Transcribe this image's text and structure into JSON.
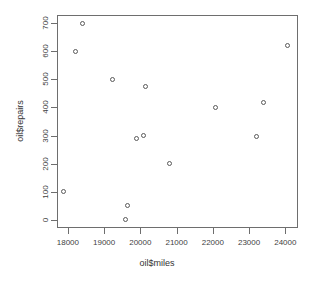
{
  "chart_data": {
    "type": "scatter",
    "title": "",
    "xlabel": "oil$miles",
    "ylabel": "oil$repairs",
    "xlim": [
      17700,
      24350
    ],
    "ylim": [
      -30,
      730
    ],
    "xticks": [
      18000,
      19000,
      20000,
      21000,
      22000,
      23000,
      24000
    ],
    "xtick_labels": [
      "18000",
      "19000",
      "20000",
      "21000",
      "22000",
      "23000",
      "24000"
    ],
    "yticks": [
      0,
      100,
      200,
      300,
      400,
      500,
      600,
      700
    ],
    "ytick_labels": [
      "0",
      "100",
      "200",
      "300",
      "400",
      "500",
      "600",
      "700"
    ],
    "grid": false,
    "legend": null,
    "marker": "open-circle",
    "marker_color": "#5a5a5a",
    "points": [
      {
        "x": 17880,
        "y": 100
      },
      {
        "x": 18200,
        "y": 600
      },
      {
        "x": 18400,
        "y": 700
      },
      {
        "x": 19230,
        "y": 500
      },
      {
        "x": 19600,
        "y": 0
      },
      {
        "x": 19640,
        "y": 50
      },
      {
        "x": 19890,
        "y": 290
      },
      {
        "x": 20100,
        "y": 300
      },
      {
        "x": 20130,
        "y": 475
      },
      {
        "x": 20810,
        "y": 200
      },
      {
        "x": 22080,
        "y": 400
      },
      {
        "x": 23200,
        "y": 298
      },
      {
        "x": 23410,
        "y": 418
      },
      {
        "x": 24060,
        "y": 620
      }
    ]
  },
  "figure": {
    "background_color": "#ffffff",
    "frame_color": "#6e6e6e",
    "text_color": "#3a3a3a"
  }
}
